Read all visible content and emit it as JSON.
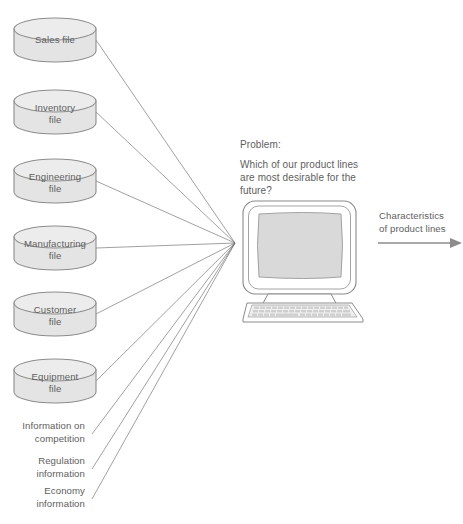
{
  "diagram": {
    "colors": {
      "cylinder_fill": "#e4e4e4",
      "cylinder_top": "#ececec",
      "cylinder_stroke": "#8d8d8d",
      "screen_fill": "#d9d9d9",
      "line_stroke": "#6e6e6e",
      "text": "#5e5e5e",
      "arrow": "#8c8c8c",
      "background": "#ffffff"
    },
    "databases": [
      {
        "id": "sales",
        "lines": [
          "Sales file"
        ],
        "cx": 55,
        "cy": 40,
        "rx": 41,
        "ry": 11,
        "h": 34
      },
      {
        "id": "inventory",
        "lines": [
          "Inventory",
          "file"
        ],
        "cx": 55,
        "cy": 112,
        "rx": 41,
        "ry": 11,
        "h": 34
      },
      {
        "id": "engineering",
        "lines": [
          "Engineering",
          "file"
        ],
        "cx": 55,
        "cy": 181,
        "rx": 41,
        "ry": 11,
        "h": 34
      },
      {
        "id": "manufacturing",
        "lines": [
          "Manufacturing",
          "file"
        ],
        "cx": 55,
        "cy": 248,
        "rx": 41,
        "ry": 11,
        "h": 34
      },
      {
        "id": "customer",
        "lines": [
          "Customer",
          "file"
        ],
        "cx": 55,
        "cy": 314,
        "rx": 41,
        "ry": 11,
        "h": 34
      },
      {
        "id": "equipment",
        "lines": [
          "Equipment",
          "file"
        ],
        "cx": 55,
        "cy": 381,
        "rx": 41,
        "ry": 11,
        "h": 34
      }
    ],
    "external_sources": [
      {
        "id": "competition",
        "lines": [
          "Information on",
          "competition"
        ],
        "anchor_x": 92,
        "anchor_y": 434,
        "text_x": 72,
        "text_y": 429
      },
      {
        "id": "regulation",
        "lines": [
          "Regulation",
          "information"
        ],
        "anchor_x": 92,
        "anchor_y": 469,
        "text_x": 80,
        "text_y": 464
      },
      {
        "id": "economy",
        "lines": [
          "Economy",
          "information"
        ],
        "anchor_x": 92,
        "anchor_y": 499,
        "text_x": 80,
        "text_y": 494
      }
    ],
    "convergence_point": {
      "x": 235,
      "y": 243
    },
    "problem": {
      "heading": "Problem:",
      "lines": [
        "Which of our product lines",
        "are most desirable for the",
        "future?"
      ]
    },
    "computer": {
      "label": "computer-terminal",
      "screen_label": ""
    },
    "output": {
      "lines": [
        "Characteristics",
        "of product lines"
      ],
      "arrow_label": "output-arrow"
    }
  }
}
